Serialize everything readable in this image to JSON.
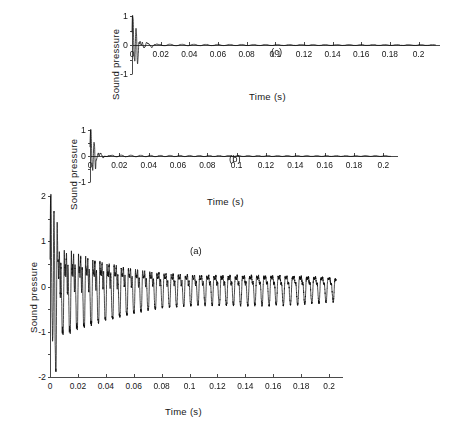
{
  "figure": {
    "background": "#ffffff",
    "ink": "#161616",
    "waveform_color": "#0d0d0d",
    "axis_color": "#4a4a4a"
  },
  "chart_data": [
    {
      "id": "panel_a",
      "type": "line",
      "tag": "(a)",
      "title": "",
      "xlabel": "Time (s)",
      "ylabel": "Sound pressure",
      "xlim": [
        0,
        0.21
      ],
      "ylim": [
        -2,
        2
      ],
      "xticks": [
        0,
        0.02,
        0.04,
        0.06,
        0.08,
        0.1,
        0.12,
        0.14,
        0.16,
        0.18,
        0.2
      ],
      "xticklabels": [
        "0",
        "0.02",
        "0.04",
        "0.06",
        "0.08",
        "0.1",
        "0.12",
        "0.14",
        "0.16",
        "0.18",
        "0.2"
      ],
      "yticks": [
        -2,
        -1,
        0,
        1,
        2
      ],
      "yticklabels": [
        "-2",
        "-1",
        "0",
        "1",
        "2"
      ],
      "grid": false,
      "legend": "none",
      "signal": {
        "description": "damped multi-partial string tone with strong onset transient",
        "duration_s": 0.205,
        "sample_count": 4600,
        "attack_peak": 2.0,
        "attack_trough": -1.85,
        "attack_end_s": 0.006,
        "steady_envelope_start": 0.95,
        "steady_envelope_end": 0.42,
        "decay_tau_s": 0.16,
        "partials": [
          {
            "freq_hz": 196,
            "amp": 1.0,
            "phase": 0.0,
            "decay_tau_s": 0.35
          },
          {
            "freq_hz": 392,
            "amp": 0.55,
            "phase": 1.1,
            "decay_tau_s": 0.22
          },
          {
            "freq_hz": 588,
            "amp": 0.38,
            "phase": 2.3,
            "decay_tau_s": 0.15
          },
          {
            "freq_hz": 784,
            "amp": 0.3,
            "phase": 0.7,
            "decay_tau_s": 0.1
          },
          {
            "freq_hz": 980,
            "amp": 0.22,
            "phase": 3.0,
            "decay_tau_s": 0.07
          },
          {
            "freq_hz": 1176,
            "amp": 0.18,
            "phase": 1.8,
            "decay_tau_s": 0.05
          },
          {
            "freq_hz": 1568,
            "amp": 0.14,
            "phase": 0.4,
            "decay_tau_s": 0.035
          },
          {
            "freq_hz": 2350,
            "amp": 0.1,
            "phase": 2.0,
            "decay_tau_s": 0.02
          },
          {
            "freq_hz": 3136,
            "amp": 0.07,
            "phase": 1.4,
            "decay_tau_s": 0.012
          }
        ],
        "beat_hz": 5.5,
        "beat_depth": 0.3,
        "noise_level": 0.05
      }
    },
    {
      "id": "panel_b",
      "type": "line",
      "tag": "(b)",
      "title": "",
      "xlabel": "Time (s)",
      "ylabel": "Sound pressure",
      "xlim": [
        0,
        0.21
      ],
      "ylim": [
        -1,
        1
      ],
      "xticks": [
        0,
        0.02,
        0.04,
        0.06,
        0.08,
        0.1,
        0.12,
        0.14,
        0.16,
        0.18,
        0.2
      ],
      "xticklabels": [
        "0",
        "0.02",
        "0.04",
        "0.06",
        "0.08",
        "0.1",
        "0.12",
        "0.14",
        "0.16",
        "0.18",
        "0.2"
      ],
      "yticks": [
        -1,
        0,
        1
      ],
      "yticklabels": [
        "-1",
        "0",
        "1"
      ],
      "grid": false,
      "legend": "none",
      "signal": {
        "description": "sharp percussive onset decaying quickly to near-zero residual ripple",
        "duration_s": 0.205,
        "sample_count": 4600,
        "attack_peak": 1.0,
        "attack_trough": -1.0,
        "attack_end_s": 0.004,
        "burst_decay_tau_s": 0.007,
        "residual_level": 0.035,
        "residual_decay_tau_s": 0.05,
        "tail_level": 0.012,
        "partials": [
          {
            "freq_hz": 196,
            "amp": 1.0,
            "phase": 0.0,
            "decay_tau_s": 0.012
          },
          {
            "freq_hz": 392,
            "amp": 0.7,
            "phase": 1.6,
            "decay_tau_s": 0.009
          },
          {
            "freq_hz": 740,
            "amp": 0.5,
            "phase": 0.5,
            "decay_tau_s": 0.006
          },
          {
            "freq_hz": 1180,
            "amp": 0.35,
            "phase": 2.4,
            "decay_tau_s": 0.004
          },
          {
            "freq_hz": 1960,
            "amp": 0.22,
            "phase": 1.0,
            "decay_tau_s": 0.003
          }
        ],
        "ripple_hz": 150,
        "noise_level": 0.02
      }
    },
    {
      "id": "panel_c",
      "type": "line",
      "tag": "(c)",
      "title": "",
      "xlabel": "Time (s)",
      "ylabel": "Sound pressure",
      "xlim": [
        0,
        0.215
      ],
      "ylim": [
        -1,
        1
      ],
      "xticks": [
        0,
        0.02,
        0.04,
        0.06,
        0.08,
        0.1,
        0.12,
        0.14,
        0.16,
        0.18,
        0.2
      ],
      "xticklabels": [
        "0",
        "0.02",
        "0.04",
        "0.06",
        "0.08",
        "0.1",
        "0.12",
        "0.14",
        "0.16",
        "0.18",
        "0.2"
      ],
      "yticks": [
        -1,
        0,
        1
      ],
      "yticklabels": [
        "-1",
        "0",
        "1"
      ],
      "grid": false,
      "legend": "none",
      "signal": {
        "description": "impulsive onset reaching unity then decaying to a faint wandering baseline",
        "duration_s": 0.212,
        "sample_count": 4600,
        "attack_peak": 1.0,
        "attack_trough": -1.0,
        "attack_end_s": 0.005,
        "burst_decay_tau_s": 0.008,
        "residual_level": 0.03,
        "residual_decay_tau_s": 0.06,
        "tail_level": 0.01,
        "partials": [
          {
            "freq_hz": 196,
            "amp": 1.0,
            "phase": 0.3,
            "decay_tau_s": 0.014
          },
          {
            "freq_hz": 392,
            "amp": 0.65,
            "phase": 2.0,
            "decay_tau_s": 0.01
          },
          {
            "freq_hz": 700,
            "amp": 0.45,
            "phase": 1.2,
            "decay_tau_s": 0.007
          },
          {
            "freq_hz": 1250,
            "amp": 0.3,
            "phase": 0.8,
            "decay_tau_s": 0.0045
          },
          {
            "freq_hz": 2100,
            "amp": 0.18,
            "phase": 2.8,
            "decay_tau_s": 0.003
          }
        ],
        "ripple_hz": 120,
        "noise_level": 0.018
      }
    }
  ]
}
